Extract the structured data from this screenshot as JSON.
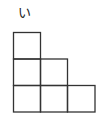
{
  "figure": {
    "label": "い",
    "shape": "staircase",
    "columns": [
      3,
      2,
      1
    ],
    "cell_size_px": 27,
    "stroke_color": "#333333"
  }
}
